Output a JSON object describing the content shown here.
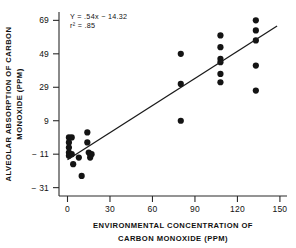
{
  "chart_data": {
    "type": "scatter",
    "title": "",
    "xlabel": "ENVIRONMENTAL CONCENTRATION OF CARBON MONOXIDE (PPM)",
    "xlabel_line1": "ENVIRONMENTAL CONCENTRATION OF",
    "xlabel_line2": "CARBON MONOXIDE (PPM)",
    "ylabel": "ALVEOLAR ABSORPTION OF CARBON MONOXIDE (PPM)",
    "ylabel_line1": "ALVEOLAR ABSORPTION OF CARBON",
    "ylabel_line2": "MONOXIDE (PPM)",
    "xlim": [
      -6,
      155
    ],
    "ylim": [
      -36,
      74
    ],
    "xticks": [
      0,
      30,
      60,
      90,
      120,
      150
    ],
    "xtick_labels": [
      "0",
      "30",
      "60",
      "90",
      "120",
      "150"
    ],
    "yticks": [
      -31,
      -11,
      9,
      29,
      49,
      69
    ],
    "ytick_labels": [
      "− 31",
      "− 11",
      "9",
      "29",
      "49",
      "69"
    ],
    "grid": false,
    "legend": null,
    "annotations": [
      "Y = .54x − 14.32",
      "r² = .85"
    ],
    "fit": {
      "type": "linear",
      "equation": "Y = .54x − 14.32",
      "r_squared": ".85",
      "slope": 0.54,
      "intercept": -14.32,
      "x_start": 0,
      "x_end": 148
    },
    "points": [
      {
        "x": 1,
        "y": -1
      },
      {
        "x": 1,
        "y": -4
      },
      {
        "x": 1,
        "y": -7
      },
      {
        "x": 1,
        "y": -10
      },
      {
        "x": 1,
        "y": -12
      },
      {
        "x": 3,
        "y": -1
      },
      {
        "x": 3,
        "y": -11
      },
      {
        "x": 4,
        "y": -17
      },
      {
        "x": 8,
        "y": -13
      },
      {
        "x": 10,
        "y": -24
      },
      {
        "x": 14,
        "y": 2
      },
      {
        "x": 14,
        "y": -4
      },
      {
        "x": 15,
        "y": -10
      },
      {
        "x": 16,
        "y": -11
      },
      {
        "x": 16,
        "y": -13
      },
      {
        "x": 17,
        "y": -11
      },
      {
        "x": 80,
        "y": 49
      },
      {
        "x": 80,
        "y": 31
      },
      {
        "x": 80,
        "y": 9
      },
      {
        "x": 108,
        "y": 60
      },
      {
        "x": 108,
        "y": 53
      },
      {
        "x": 108,
        "y": 46
      },
      {
        "x": 108,
        "y": 44
      },
      {
        "x": 108,
        "y": 37
      },
      {
        "x": 108,
        "y": 32
      },
      {
        "x": 133,
        "y": 69
      },
      {
        "x": 133,
        "y": 63
      },
      {
        "x": 133,
        "y": 57
      },
      {
        "x": 133,
        "y": 42
      },
      {
        "x": 133,
        "y": 27
      }
    ]
  }
}
